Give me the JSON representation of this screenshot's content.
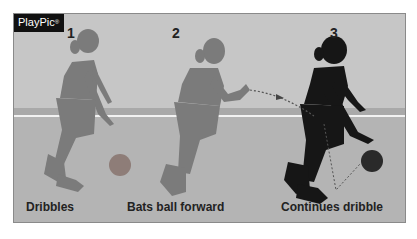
{
  "logo": {
    "text": "PlayPic",
    "mark": "®"
  },
  "steps": [
    {
      "number": "1",
      "caption": "Dribbles",
      "color": "#7a7a7a"
    },
    {
      "number": "2",
      "caption": "Bats ball forward",
      "color": "#7a7a7a"
    },
    {
      "number": "3",
      "caption": "Continues dribble",
      "color": "#151515"
    }
  ],
  "colors": {
    "background": "#c6c6c6",
    "band": "#a9a9a9",
    "floor": "#b4b4b4",
    "court_line": "#f2f2f2"
  }
}
